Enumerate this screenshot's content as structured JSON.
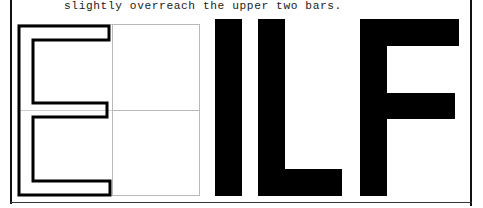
{
  "page": {
    "width_px": 483,
    "height_px": 208,
    "background_color": "#ffffff",
    "ink_color": "#000000",
    "guide_color": "#b9b9b9"
  },
  "caption": {
    "text": "slightly overreach the upper two bars."
  },
  "frame": {
    "left_rule_name": "left-page-rule",
    "right_rule_name": "right-page-rule",
    "bottom_rule_name": "bottom-page-rule"
  },
  "figure_left": {
    "glyph": "E",
    "style": "outline",
    "description": "outlined capital E with guide grid",
    "guide_box_label": "guide-box",
    "guide_lines": [
      "top-guide",
      "middle-guide",
      "bottom-guide"
    ]
  },
  "figure_right": {
    "text": "ILF",
    "style": "solid",
    "glyphs": [
      {
        "char": "I",
        "parts": [
          "stem"
        ]
      },
      {
        "char": "L",
        "parts": [
          "stem",
          "foot"
        ]
      },
      {
        "char": "F",
        "parts": [
          "stem",
          "top-arm",
          "middle-arm"
        ]
      }
    ]
  }
}
